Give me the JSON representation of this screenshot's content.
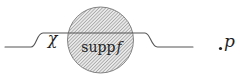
{
  "figure": {
    "type": "math-diagram",
    "description_labels": {
      "chi_label": "χ",
      "supp_label_roman": "supp",
      "supp_label_italic": "f",
      "point_label": "p"
    }
  },
  "colors": {
    "curve": "#555555",
    "circle_outline": "#777777",
    "hatch_line": "#a6a6a6",
    "hatch_fill": "#e9e9e9",
    "label": "#1f1f1f",
    "background": "#ffffff"
  }
}
